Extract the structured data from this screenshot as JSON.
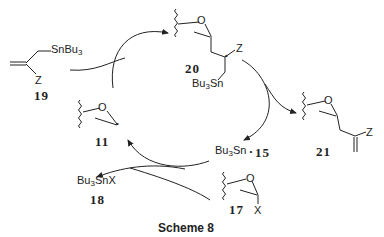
{
  "scheme": {
    "title": "Scheme 8",
    "compounds": [
      {
        "id": "19",
        "label": "19",
        "substituents": [
          "SnBu3",
          "Z"
        ],
        "description": "allylstannane"
      },
      {
        "id": "20",
        "label": "20",
        "substituents": [
          "Z",
          "Bu3Sn"
        ],
        "description": "adduct radical"
      },
      {
        "id": "21",
        "label": "21",
        "substituents": [
          "Z"
        ],
        "description": "allylated oxetane product"
      },
      {
        "id": "11",
        "label": "11",
        "substituents": [],
        "description": "oxetanyl radical"
      },
      {
        "id": "15",
        "label": "15",
        "substituents": [
          "Bu3Sn"
        ],
        "description": "tributyltin radical"
      },
      {
        "id": "17",
        "label": "17",
        "substituents": [
          "X"
        ],
        "description": "halo-oxetane"
      },
      {
        "id": "18",
        "label": "18",
        "substituents": [
          "Bu3SnX"
        ],
        "description": "tin halide"
      }
    ],
    "texts": {
      "snbu3_base": "SnBu",
      "snbu3_sub": "3",
      "z": "Z",
      "x": "X",
      "o": "O",
      "bu3sn_base_a": "Bu",
      "bu3sn_sub": "3",
      "bu3sn_base_b": "Sn",
      "radical_dot": "•",
      "bu3snx_base_a": "Bu",
      "bu3snx_sub": "3",
      "bu3snx_base_b": "SnX"
    },
    "arrows": [
      {
        "from": "19",
        "to": "20",
        "kind": "entry-into-cycle"
      },
      {
        "from": "11",
        "to": "20",
        "kind": "cycle"
      },
      {
        "from": "20",
        "to": "15",
        "kind": "cycle"
      },
      {
        "from": "20",
        "to": "21",
        "kind": "exit-from-cycle"
      },
      {
        "from": "15",
        "to": "11",
        "kind": "cycle"
      },
      {
        "from": "17",
        "to": "11",
        "kind": "entry-into-cycle"
      },
      {
        "from": "17",
        "to": "18",
        "kind": "exit-from-cycle"
      }
    ]
  }
}
